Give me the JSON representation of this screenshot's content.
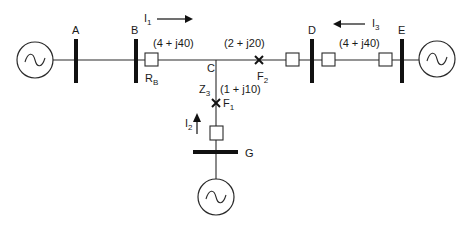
{
  "diagram": {
    "type": "single-line power system diagram",
    "buses": [
      {
        "id": "A",
        "label": "A"
      },
      {
        "id": "B",
        "label": "B"
      },
      {
        "id": "C",
        "label": "C"
      },
      {
        "id": "D",
        "label": "D"
      },
      {
        "id": "E",
        "label": "E"
      },
      {
        "id": "G",
        "label": "G"
      }
    ],
    "generators": [
      {
        "id": "gen-A",
        "at_bus": "A",
        "symbol": "~"
      },
      {
        "id": "gen-E",
        "at_bus": "E",
        "symbol": "~"
      },
      {
        "id": "gen-G",
        "at_bus": "G",
        "symbol": "~"
      }
    ],
    "lines": [
      {
        "from": "B",
        "to": "C",
        "impedance": "(4 + j40)"
      },
      {
        "from": "C",
        "to": "D",
        "impedance": "(2 + j20)"
      },
      {
        "from": "D",
        "to": "E",
        "impedance": "(4 + j40)"
      },
      {
        "from": "C",
        "to": "G",
        "impedance": "(1 + j10)",
        "name": "Z",
        "name_sub": "3"
      }
    ],
    "relay": {
      "label": "R",
      "sub": "B"
    },
    "faults": [
      {
        "label": "F",
        "sub": "1"
      },
      {
        "label": "F",
        "sub": "2"
      }
    ],
    "currents": [
      {
        "label": "I",
        "sub": "1",
        "direction": "right"
      },
      {
        "label": "I",
        "sub": "2",
        "direction": "up"
      },
      {
        "label": "I",
        "sub": "3",
        "direction": "left"
      }
    ]
  }
}
